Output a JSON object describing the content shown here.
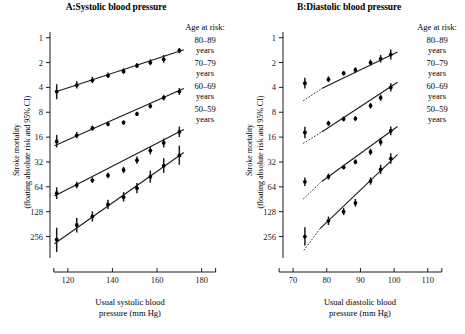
{
  "figure": {
    "panels": [
      {
        "id": "A",
        "title": "A:Systolic blood pressure",
        "xlabel_line1": "Usual systolic blood",
        "xlabel_line2": "pressure (mm Hg)",
        "ylabel_line1": "Stroke mortality",
        "ylabel_line2": "(floating absolute risk and 95% CI)",
        "legend_title": "Age at risk:",
        "legend_items": [
          {
            "range": "80–89",
            "unit": "years"
          },
          {
            "range": "70–79",
            "unit": "years"
          },
          {
            "range": "60–69",
            "unit": "years"
          },
          {
            "range": "50–59",
            "unit": "years"
          }
        ],
        "xticks": [
          "120",
          "140",
          "160",
          "180"
        ],
        "yticks": [
          "256",
          "128",
          "64",
          "32",
          "16",
          "8",
          "4",
          "2",
          "1"
        ]
      },
      {
        "id": "B",
        "title": "B:Diastolic blood pressure",
        "xlabel_line1": "Usual diastolic blood",
        "xlabel_line2": "pressure (mm Hg)",
        "ylabel_line1": "Stroke mortality",
        "ylabel_line2": "(floating absolute risk and 95% CI)",
        "legend_title": "Age at risk:",
        "legend_items": [
          {
            "range": "80–89",
            "unit": "years"
          },
          {
            "range": "70–79",
            "unit": "years"
          },
          {
            "range": "60–69",
            "unit": "years"
          },
          {
            "range": "50–59",
            "unit": "years"
          }
        ],
        "xticks": [
          "70",
          "80",
          "90",
          "100",
          "110"
        ],
        "yticks": [
          "256",
          "128",
          "64",
          "32",
          "16",
          "8",
          "4",
          "2",
          "1"
        ]
      }
    ]
  },
  "chart_data": [
    {
      "type": "scatter",
      "panel": "A",
      "title": "A:Systolic blood pressure",
      "xlabel": "Usual systolic blood pressure (mm Hg)",
      "ylabel": "Stroke mortality (floating absolute risk and 95% CI)",
      "yscale": "log2",
      "xlim": [
        112,
        186
      ],
      "ylim": [
        0.55,
        300
      ],
      "xticks": [
        120,
        140,
        160,
        180
      ],
      "yticks": [
        1,
        2,
        4,
        8,
        16,
        32,
        64,
        128,
        256
      ],
      "grid": false,
      "legend_position": "right",
      "series": [
        {
          "name": "80–89 years",
          "x": [
            115,
            124,
            131,
            138,
            145,
            151,
            157,
            163,
            170
          ],
          "y": [
            57,
            68,
            78,
            89,
            100,
            117,
            128,
            140,
            178
          ],
          "ci_low": [
            46,
            62,
            72,
            83,
            94,
            110,
            119,
            127,
            166
          ],
          "ci_high": [
            70,
            76,
            86,
            97,
            109,
            126,
            140,
            158,
            192
          ],
          "fit_line": {
            "x0": 115,
            "y0": 57,
            "x1": 172,
            "y1": 183
          }
        },
        {
          "name": "70–79 years",
          "x": [
            115,
            124,
            131,
            138,
            145,
            151,
            157,
            163,
            170
          ],
          "y": [
            14.2,
            16.8,
            20.5,
            23.0,
            24.0,
            30.5,
            38.0,
            48.0,
            57.0
          ],
          "ci_low": [
            12.0,
            15.5,
            19.2,
            21.6,
            22.6,
            28.8,
            35.5,
            44.5,
            52.0
          ],
          "ci_high": [
            17.0,
            18.4,
            22.0,
            24.6,
            25.6,
            32.5,
            41.0,
            52.0,
            63.0
          ],
          "fit_line": {
            "x0": 114,
            "y0": 12.6,
            "x1": 172,
            "y1": 62
          }
        },
        {
          "name": "60–69 years",
          "x": [
            115,
            124,
            131,
            138,
            145,
            151,
            157,
            163,
            170
          ],
          "y": [
            3.35,
            4.2,
            4.8,
            5.5,
            6.4,
            8.4,
            11.0,
            13.6,
            18.5
          ],
          "ci_low": [
            2.85,
            3.85,
            4.45,
            5.1,
            5.85,
            7.6,
            9.9,
            12.0,
            16.0
          ],
          "ci_high": [
            3.95,
            4.6,
            5.2,
            5.95,
            7.0,
            9.3,
            12.3,
            15.4,
            21.5
          ],
          "fit_line": {
            "x0": 114,
            "y0": 3.1,
            "x1": 172,
            "y1": 19.8
          }
        },
        {
          "name": "50–59 years",
          "x": [
            115,
            124,
            131,
            138,
            145,
            151,
            157,
            163,
            170
          ],
          "y": [
            0.92,
            1.38,
            1.75,
            2.45,
            3.0,
            3.85,
            5.3,
            7.2,
            9.6
          ],
          "ci_low": [
            0.65,
            1.12,
            1.52,
            2.15,
            2.65,
            3.35,
            4.5,
            5.9,
            7.4
          ],
          "ci_high": [
            1.28,
            1.68,
            2.02,
            2.8,
            3.45,
            4.45,
            6.3,
            8.9,
            12.6
          ],
          "fit_line": {
            "x0": 114,
            "y0": 0.82,
            "x1": 172,
            "y1": 10.4
          }
        }
      ]
    },
    {
      "type": "scatter",
      "panel": "B",
      "title": "B:Diastolic blood pressure",
      "xlabel": "Usual diastolic blood pressure (mm Hg)",
      "ylabel": "Stroke mortality (floating absolute risk and 95% CI)",
      "yscale": "log2",
      "xlim": [
        67,
        116
      ],
      "ylim": [
        0.55,
        300
      ],
      "xticks": [
        70,
        80,
        90,
        100,
        110
      ],
      "yticks": [
        1,
        2,
        4,
        8,
        16,
        32,
        64,
        128,
        256
      ],
      "grid": false,
      "legend_position": "right",
      "series": [
        {
          "name": "80–89 years",
          "x": [
            73.5,
            80.5,
            85.0,
            88.5,
            93.0,
            96.0,
            99.0
          ],
          "y": [
            72,
            80,
            95,
            104,
            128,
            142,
            160
          ],
          "ci_low": [
            62,
            74,
            89,
            97,
            118,
            128,
            139
          ],
          "ci_high": [
            84,
            87,
            101,
            112,
            139,
            158,
            184
          ],
          "fit_line": {
            "x0": 78.5,
            "y0": 62,
            "x1": 101,
            "y1": 172
          },
          "fit_dotted": {
            "x0": 73.0,
            "y0": 44,
            "x1": 78.5,
            "y1": 62
          }
        },
        {
          "name": "70–79 years",
          "x": [
            73.5,
            80.5,
            85.0,
            88.5,
            93.0,
            96.0,
            99.0
          ],
          "y": [
            18.2,
            23.5,
            26.5,
            26.8,
            38.5,
            48.0,
            64.0
          ],
          "ci_low": [
            15.5,
            21.8,
            24.8,
            25.0,
            35.5,
            44.0,
            57.0
          ],
          "ci_high": [
            21.4,
            25.3,
            28.4,
            28.8,
            41.5,
            52.5,
            72.0
          ],
          "fit_line": {
            "x0": 78.5,
            "y0": 18.5,
            "x1": 101,
            "y1": 74
          },
          "fit_dotted": {
            "x0": 73.0,
            "y0": 13.4,
            "x1": 78.5,
            "y1": 18.5
          }
        },
        {
          "name": "60–69 years",
          "x": [
            73.5,
            80.5,
            85.0,
            88.5,
            93.0,
            96.0,
            99.0
          ],
          "y": [
            4.6,
            5.3,
            6.9,
            8.0,
            10.6,
            14.0,
            19.0
          ],
          "ci_low": [
            4.1,
            4.9,
            6.5,
            7.5,
            9.7,
            12.6,
            16.8
          ],
          "ci_high": [
            5.2,
            5.8,
            7.4,
            8.6,
            11.6,
            15.6,
            21.5
          ],
          "fit_line": {
            "x0": 78.5,
            "y0": 4.65,
            "x1": 101,
            "y1": 21.5
          },
          "fit_dotted": {
            "x0": 73.0,
            "y0": 2.85,
            "x1": 78.5,
            "y1": 4.65
          }
        },
        {
          "name": "50–59 years",
          "x": [
            73.5,
            80.5,
            85.0,
            88.5,
            93.0,
            96.0,
            99.0
          ],
          "y": [
            1.0,
            1.55,
            2.0,
            2.55,
            4.7,
            6.5,
            8.8
          ],
          "ci_low": [
            0.78,
            1.38,
            1.82,
            2.3,
            4.25,
            5.7,
            7.6
          ],
          "ci_high": [
            1.3,
            1.75,
            2.22,
            2.85,
            5.2,
            7.4,
            10.2
          ],
          "fit_line": {
            "x0": 78.0,
            "y0": 1.25,
            "x1": 101,
            "y1": 9.8
          },
          "fit_dotted": {
            "x0": 73.2,
            "y0": 0.68,
            "x1": 78.0,
            "y1": 1.25
          }
        }
      ]
    }
  ]
}
